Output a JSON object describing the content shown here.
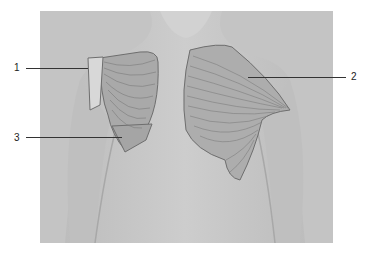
{
  "figure": {
    "type": "anatomical illustration",
    "labels": [
      {
        "id": "1",
        "text": "1"
      },
      {
        "id": "2",
        "text": "2"
      },
      {
        "id": "3",
        "text": "3"
      }
    ]
  }
}
